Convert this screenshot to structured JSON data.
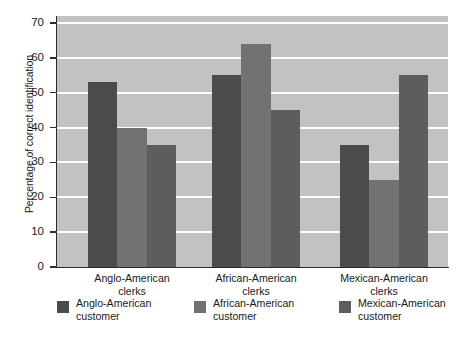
{
  "chart_data": {
    "type": "bar",
    "title": "",
    "xlabel": "",
    "ylabel": "Percentage of correct identification",
    "ylim": [
      0,
      72
    ],
    "yticks": [
      0,
      10,
      20,
      30,
      40,
      50,
      60,
      70
    ],
    "ytick_labels": [
      "0",
      "10",
      "20",
      "30",
      "40",
      "50",
      "60",
      "70"
    ],
    "grid": true,
    "grid_axis": "y",
    "legend_position": "below",
    "categories": [
      "Anglo-American\nclerks",
      "African-American\nclerks",
      "Mexican-American\nclerks"
    ],
    "series": [
      {
        "name": "Anglo-American customer",
        "values": [
          53,
          55,
          35
        ],
        "color": "#4b4b4b"
      },
      {
        "name": "African-American customer",
        "values": [
          40,
          64,
          25
        ],
        "color": "#727272"
      },
      {
        "name": "Mexican-American customer",
        "values": [
          35,
          45,
          55
        ],
        "color": "#5d5d5d"
      }
    ],
    "plot_background": "#c2c2c2",
    "gridline_color": "#fdfdfd",
    "axis_color": "#2b2b2b"
  },
  "axis": {
    "y_title": "Percentage of correct identification",
    "y_ticks": [
      "70",
      "60",
      "50",
      "40",
      "30",
      "20",
      "10",
      "0"
    ],
    "x_categories": [
      {
        "line1": "Anglo-American",
        "line2": "clerks"
      },
      {
        "line1": "African-American",
        "line2": "clerks"
      },
      {
        "line1": "Mexican-American",
        "line2": "clerks"
      }
    ]
  },
  "legend": {
    "items": [
      {
        "line1": "Anglo-American",
        "line2": "customer",
        "color": "#4b4b4b"
      },
      {
        "line1": "African-American",
        "line2": "customer",
        "color": "#727272"
      },
      {
        "line1": "Mexican-American",
        "line2": "customer",
        "color": "#5d5d5d"
      }
    ]
  }
}
